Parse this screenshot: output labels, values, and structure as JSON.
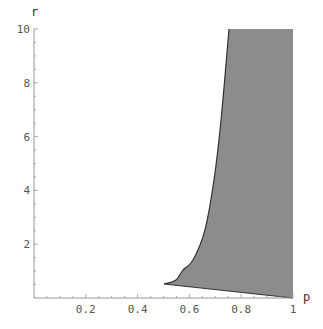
{
  "chart_data": {
    "type": "area",
    "title": "",
    "xlabel": "p",
    "ylabel": "r",
    "xlim": [
      0,
      1
    ],
    "ylim": [
      0,
      10
    ],
    "grid": false,
    "x_ticks": [
      0.2,
      0.4,
      0.6,
      0.8,
      1
    ],
    "x_tick_labels": [
      "0.2",
      "0.4",
      "0.6",
      "0.8",
      "1"
    ],
    "y_ticks": [
      2,
      4,
      6,
      8,
      10
    ],
    "y_tick_labels": [
      "2",
      "4",
      "6",
      "8",
      "10"
    ],
    "fill_color": "#8c8c8c",
    "edge_color": "#333333",
    "region": {
      "description": "Shaded region bounded by left curve, top r=10, right p=1, and bottom line r=1-p",
      "left_boundary_curve": [
        {
          "p": 0.502,
          "r": 0.52
        },
        {
          "p": 0.548,
          "r": 0.67
        },
        {
          "p": 0.575,
          "r": 1.04
        },
        {
          "p": 0.614,
          "r": 1.41
        },
        {
          "p": 0.66,
          "r": 2.53
        },
        {
          "p": 0.695,
          "r": 4.39
        },
        {
          "p": 0.722,
          "r": 6.6
        },
        {
          "p": 0.753,
          "r": 10
        }
      ],
      "top_boundary": {
        "r": 10,
        "p_from": 0.753,
        "p_to": 1
      },
      "right_boundary": {
        "p": 1,
        "r_from": 0,
        "r_to": 10
      },
      "bottom_boundary_line": [
        {
          "p": 1,
          "r": 0
        },
        {
          "p": 0.502,
          "r": 0.52
        }
      ]
    }
  }
}
